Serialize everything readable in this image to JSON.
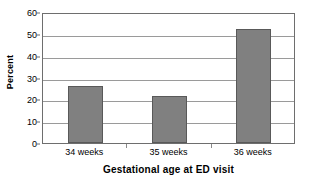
{
  "chart_data": {
    "type": "bar",
    "title": "",
    "categories": [
      "34 weeks",
      "35 weeks",
      "36 weeks"
    ],
    "values": [
      26,
      21.5,
      52
    ],
    "series": [
      {
        "name": "Percent",
        "values": [
          26,
          21.5,
          52
        ]
      }
    ],
    "xlabel": "Gestational age at ED visit",
    "ylabel": "Percent",
    "ylim": [
      0,
      60
    ],
    "ytick_step": 10,
    "yticks": [
      0,
      10,
      20,
      30,
      40,
      50,
      60
    ],
    "ytick_labels": [
      "0",
      "10",
      "20",
      "30",
      "40",
      "50",
      "60"
    ],
    "grid": true,
    "legend": false,
    "legend_position": "none",
    "bar_color": "#808080",
    "bar_border_color": "#595959",
    "gridline_color": "#9a9a9a",
    "axis_color": "#6e6e6e",
    "plot_background": "#ffffff"
  }
}
